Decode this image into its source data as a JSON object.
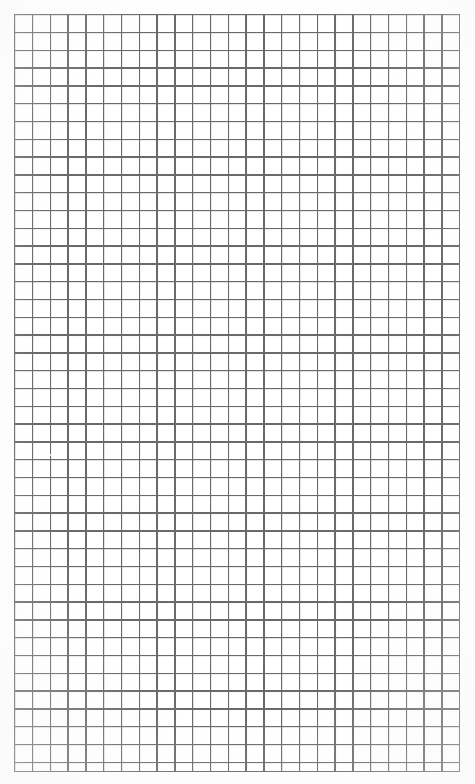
{
  "document": {
    "kind": "grid-paper",
    "title": "",
    "text_content": "",
    "has_text": false,
    "has_annotations": false
  },
  "canvas": {
    "width": 475,
    "height": 784,
    "background_color": "#ffffff",
    "paper_color": "#fefefe"
  },
  "chart_data": {
    "type": "table",
    "title": "",
    "subtitle": "",
    "xlabel": "",
    "ylabel": "",
    "annotations": [],
    "legend": [],
    "grid": true,
    "grid_only": true,
    "columns": 25,
    "rows": 42,
    "cell_width_px": 17.8,
    "cell_height_px": 17.8,
    "origin_x_px": 14,
    "origin_y_px": 14,
    "extent_x_px": 445,
    "extent_y_px": 757,
    "line_color": "#6a6a6a",
    "line_width_px": 1.4,
    "cell_fill": "#ffffff",
    "categories": [],
    "values": [],
    "tick_labels_x": [],
    "tick_labels_y": []
  },
  "artifacts": {
    "scan_mark": {
      "name": "faint-bleach-mark",
      "x": 46,
      "y": 454,
      "width": 16,
      "height": 2
    }
  }
}
